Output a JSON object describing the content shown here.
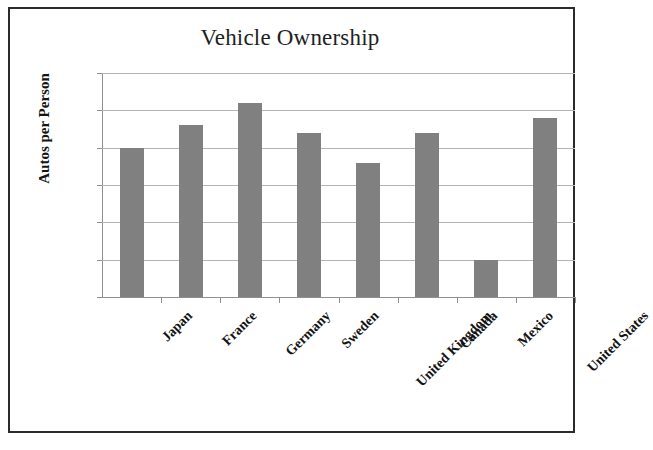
{
  "chart_data": {
    "type": "bar",
    "title": "Vehicle Ownership",
    "xlabel": "",
    "ylabel": "Autos per Person",
    "categories": [
      "Japan",
      "France",
      "Germany",
      "Sweden",
      "United Kingdom",
      "Canada",
      "Mexico",
      "United States"
    ],
    "values": [
      0.4,
      0.46,
      0.52,
      0.44,
      0.36,
      0.44,
      0.1,
      0.48
    ],
    "ylim": [
      0,
      0.6
    ],
    "ytick_labels": [
      "0",
      "0.1",
      "0.2",
      "0.3",
      "0.4",
      "0.5",
      "0.6"
    ],
    "ytick_values": [
      0,
      0.1,
      0.2,
      0.3,
      0.4,
      0.5,
      0.6
    ],
    "grid": true,
    "legend": false,
    "bar_color": "#808080",
    "gridline_color": "#b4b4b4",
    "axis_color": "#8f8f8f",
    "frame_color": "#2b2b2b"
  }
}
